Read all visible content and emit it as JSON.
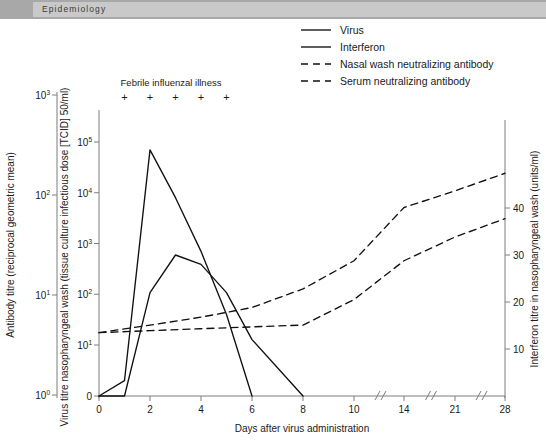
{
  "header": {
    "title": "Epidemiology"
  },
  "legend": {
    "position": "top-right",
    "entries": [
      {
        "label": "Virus",
        "style": "solid"
      },
      {
        "label": "Interferon",
        "style": "solid"
      },
      {
        "label": "Nasal wash neutralizing antibody",
        "style": "dashed"
      },
      {
        "label": "Serum neutralizing antibody",
        "style": "dashed"
      }
    ]
  },
  "annotation": {
    "text": "Febrile influenzal illness",
    "markers": [
      "+",
      "+",
      "+",
      "+",
      "+"
    ],
    "marker_days": [
      1,
      2,
      3,
      4,
      5
    ]
  },
  "chart_data": {
    "type": "line",
    "title": "",
    "xlabel": "Days after virus administration",
    "x_ticks": [
      0,
      2,
      4,
      6,
      8,
      10,
      14,
      21,
      28
    ],
    "x_tick_labels": [
      "0",
      "2",
      "4",
      "6",
      "8",
      "10",
      "14",
      "21",
      "28"
    ],
    "x_axis_breaks": [
      12,
      17.5,
      24.5
    ],
    "grid": false,
    "axes": [
      {
        "id": "antibody",
        "side": "left-outer",
        "label": "Antibody titre (reciprocal geometric mean)",
        "scale": "log",
        "tick_labels": [
          "10⁰",
          "10¹",
          "10²",
          "10³"
        ],
        "tick_values": [
          1,
          10,
          100,
          1000
        ],
        "ylim": [
          1,
          1000
        ]
      },
      {
        "id": "virus",
        "side": "left-inner",
        "label": "Virus titre nasopharyngeal wash (tissue culture infectious dose [TCID] 50/ml)",
        "scale": "log-with-zero",
        "tick_labels": [
          "0",
          "10¹",
          "10²",
          "10³",
          "10⁴",
          "10⁵"
        ],
        "tick_values": [
          0,
          10,
          100,
          1000,
          10000,
          100000
        ],
        "ylim": [
          0,
          100000
        ]
      },
      {
        "id": "interferon",
        "side": "right",
        "label": "Interferon titre in nasopharyngeal wash (units/ml)",
        "scale": "linear",
        "tick_labels": [
          "10",
          "20",
          "30",
          "40"
        ],
        "tick_values": [
          10,
          20,
          30,
          40
        ],
        "ylim": [
          0,
          48
        ]
      }
    ],
    "series": [
      {
        "name": "Virus",
        "axis": "virus",
        "style": "solid",
        "unit": "TCID50/ml",
        "points": [
          {
            "day": 0,
            "value": 0
          },
          {
            "day": 1,
            "value": 2
          },
          {
            "day": 2,
            "value": 70000
          },
          {
            "day": 3,
            "value": 8000
          },
          {
            "day": 4,
            "value": 700
          },
          {
            "day": 5,
            "value": 40
          },
          {
            "day": 6,
            "value": 0
          }
        ]
      },
      {
        "name": "Interferon",
        "axis": "interferon",
        "style": "solid",
        "unit": "units/ml",
        "points": [
          {
            "day": 0,
            "value": 0
          },
          {
            "day": 1,
            "value": 0
          },
          {
            "day": 2,
            "value": 22
          },
          {
            "day": 3,
            "value": 30
          },
          {
            "day": 4,
            "value": 28
          },
          {
            "day": 5,
            "value": 22
          },
          {
            "day": 6,
            "value": 12
          },
          {
            "day": 8,
            "value": 0
          }
        ]
      },
      {
        "name": "Nasal wash neutralizing antibody",
        "axis": "antibody",
        "style": "dashed",
        "unit": "reciprocal geometric mean",
        "points": [
          {
            "day": 0,
            "value": 4.2
          },
          {
            "day": 2,
            "value": 5.0
          },
          {
            "day": 4,
            "value": 6.0
          },
          {
            "day": 6,
            "value": 7.5
          },
          {
            "day": 8,
            "value": 11.5
          },
          {
            "day": 10,
            "value": 22
          },
          {
            "day": 14,
            "value": 75
          },
          {
            "day": 21,
            "value": 110
          },
          {
            "day": 28,
            "value": 165
          }
        ]
      },
      {
        "name": "Serum neutralizing antibody",
        "axis": "antibody",
        "style": "dashed",
        "unit": "reciprocal geometric mean",
        "points": [
          {
            "day": 0,
            "value": 4.2
          },
          {
            "day": 2,
            "value": 4.4
          },
          {
            "day": 4,
            "value": 4.6
          },
          {
            "day": 6,
            "value": 4.8
          },
          {
            "day": 8,
            "value": 5.0
          },
          {
            "day": 10,
            "value": 9.0
          },
          {
            "day": 14,
            "value": 22
          },
          {
            "day": 21,
            "value": 38
          },
          {
            "day": 28,
            "value": 58
          }
        ]
      }
    ]
  }
}
